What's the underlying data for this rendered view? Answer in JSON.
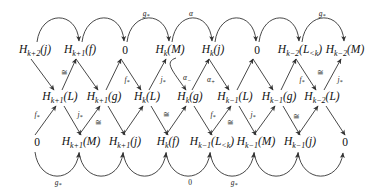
{
  "diagram": {
    "type": "braid-commutative-diagram",
    "rows": {
      "top": [
        {
          "id": "t1",
          "base": "H",
          "sub": "k+2",
          "arg": "(j)",
          "x": 35,
          "y": 51
        },
        {
          "id": "t2",
          "base": "H",
          "sub": "k+1",
          "arg": "(f)",
          "x": 80,
          "y": 51
        },
        {
          "id": "t3",
          "base": "0",
          "sub": "",
          "arg": "",
          "x": 125,
          "y": 51
        },
        {
          "id": "t4",
          "base": "H",
          "sub": "k",
          "arg": "(M)",
          "x": 170,
          "y": 51
        },
        {
          "id": "t5",
          "base": "H",
          "sub": "k",
          "arg": "(j)",
          "x": 213,
          "y": 51
        },
        {
          "id": "t6",
          "base": "0",
          "sub": "",
          "arg": "",
          "x": 257,
          "y": 51
        },
        {
          "id": "t7",
          "base": "H",
          "sub": "k−2",
          "arg": "(L<k)",
          "x": 300,
          "y": 51
        },
        {
          "id": "t8",
          "base": "H",
          "sub": "k−2",
          "arg": "(M)",
          "x": 345,
          "y": 51
        }
      ],
      "middle": [
        {
          "id": "m1",
          "base": "H",
          "sub": "k+1",
          "arg": "(L)",
          "x": 60,
          "y": 98
        },
        {
          "id": "m2",
          "base": "H",
          "sub": "k+1",
          "arg": "(g)",
          "x": 104,
          "y": 98
        },
        {
          "id": "m3",
          "base": "H",
          "sub": "k",
          "arg": "(L)",
          "x": 147,
          "y": 98
        },
        {
          "id": "m4",
          "base": "H",
          "sub": "k",
          "arg": "(g)",
          "x": 190,
          "y": 98
        },
        {
          "id": "m5",
          "base": "H",
          "sub": "k−1",
          "arg": "(L)",
          "x": 235,
          "y": 98
        },
        {
          "id": "m6",
          "base": "H",
          "sub": "k−1",
          "arg": "(g)",
          "x": 279,
          "y": 98
        },
        {
          "id": "m7",
          "base": "H",
          "sub": "k−2",
          "arg": "(L)",
          "x": 322,
          "y": 98
        }
      ],
      "bottom": [
        {
          "id": "b1",
          "base": "0",
          "sub": "",
          "arg": "",
          "x": 37,
          "y": 143
        },
        {
          "id": "b2",
          "base": "H",
          "sub": "k+1",
          "arg": "(M)",
          "x": 81,
          "y": 143
        },
        {
          "id": "b3",
          "base": "H",
          "sub": "k+1",
          "arg": "(j)",
          "x": 125,
          "y": 143
        },
        {
          "id": "b4",
          "base": "H",
          "sub": "k",
          "arg": "(f)",
          "x": 168,
          "y": 143
        },
        {
          "id": "b5",
          "base": "H",
          "sub": "k−1",
          "arg": "(L<k)",
          "x": 212,
          "y": 143
        },
        {
          "id": "b6",
          "base": "H",
          "sub": "k−1",
          "arg": "(M)",
          "x": 256,
          "y": 143
        },
        {
          "id": "b7",
          "base": "H",
          "sub": "k−1",
          "arg": "(j)",
          "x": 300,
          "y": 143
        },
        {
          "id": "b8",
          "base": "0",
          "sub": "",
          "arg": "",
          "x": 345,
          "y": 143
        }
      ]
    },
    "top_arc_labels": [
      {
        "text": "g*",
        "x": 146,
        "y": 14
      },
      {
        "text": "α",
        "x": 191,
        "y": 14
      },
      {
        "text": "g*",
        "x": 322,
        "y": 14
      }
    ],
    "bottom_arc_labels": [
      {
        "text": "g*",
        "x": 58,
        "y": 183
      },
      {
        "text": "0",
        "x": 190,
        "y": 183
      },
      {
        "text": "g*",
        "x": 234,
        "y": 183
      }
    ],
    "diagonal_labels": [
      {
        "text": "≅",
        "x": 64,
        "y": 73
      },
      {
        "text": "f*",
        "x": 127,
        "y": 80
      },
      {
        "text": "j*",
        "x": 163,
        "y": 80
      },
      {
        "text": "α−",
        "x": 187,
        "y": 78
      },
      {
        "text": "α+",
        "x": 211,
        "y": 80
      },
      {
        "text": "f*",
        "x": 302,
        "y": 80
      },
      {
        "text": "≅",
        "x": 320,
        "y": 73
      },
      {
        "text": "j*",
        "x": 340,
        "y": 80
      },
      {
        "text": "f*",
        "x": 37,
        "y": 115
      },
      {
        "text": "j*",
        "x": 80,
        "y": 115
      },
      {
        "text": "≅",
        "x": 98,
        "y": 123
      },
      {
        "text": "≅",
        "x": 166,
        "y": 115
      },
      {
        "text": "f*",
        "x": 213,
        "y": 115
      },
      {
        "text": "≅",
        "x": 230,
        "y": 123
      },
      {
        "text": "j*",
        "x": 253,
        "y": 115
      },
      {
        "text": "≅",
        "x": 296,
        "y": 117
      }
    ],
    "colors": {
      "arrow": "#333333",
      "text": "#111111",
      "background": "#ffffff"
    }
  }
}
